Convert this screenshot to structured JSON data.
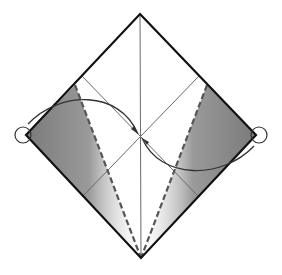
{
  "diagram": {
    "type": "origami-fold-step",
    "colors": {
      "edge": "#111111",
      "crease": "#6a6a6a",
      "dashed_fold": "#555555",
      "shade_dark": "#7a7a7a",
      "shade_light": "#ffffff",
      "arrow": "#333333"
    },
    "points": {
      "top": [
        140,
        14
      ],
      "left": [
        26,
        135
      ],
      "right": [
        256,
        135
      ],
      "bottom": [
        141,
        258
      ],
      "center": [
        140,
        136
      ]
    },
    "markers": {
      "left_circle": [
        23,
        135
      ],
      "right_circle": [
        259,
        135
      ],
      "radius": 8
    }
  }
}
